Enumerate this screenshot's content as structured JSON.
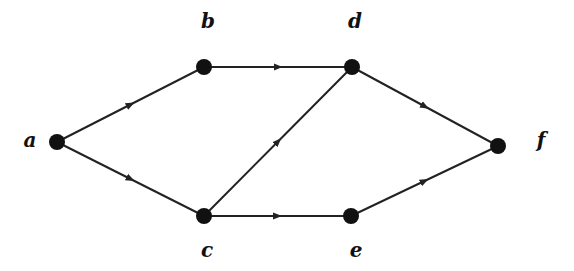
{
  "diagram": {
    "type": "directed-graph",
    "colors": {
      "node": "#111111",
      "edge": "#222222",
      "label": "#111111",
      "background": "#ffffff"
    },
    "nodes": [
      {
        "id": "a",
        "label": "a",
        "x": 57,
        "y": 142,
        "lx": 30,
        "ly": 147
      },
      {
        "id": "b",
        "label": "b",
        "x": 204,
        "y": 67,
        "lx": 208,
        "ly": 28
      },
      {
        "id": "c",
        "label": "c",
        "x": 204,
        "y": 216,
        "lx": 207,
        "ly": 257
      },
      {
        "id": "d",
        "label": "d",
        "x": 352,
        "y": 67,
        "lx": 355,
        "ly": 28
      },
      {
        "id": "e",
        "label": "e",
        "x": 351,
        "y": 216,
        "lx": 356,
        "ly": 257
      },
      {
        "id": "f",
        "label": "f",
        "x": 498,
        "y": 146,
        "lx": 541,
        "ly": 147
      }
    ],
    "edges": [
      {
        "from": "a",
        "to": "b"
      },
      {
        "from": "a",
        "to": "c"
      },
      {
        "from": "b",
        "to": "d"
      },
      {
        "from": "c",
        "to": "d"
      },
      {
        "from": "c",
        "to": "e"
      },
      {
        "from": "d",
        "to": "f"
      },
      {
        "from": "e",
        "to": "f"
      }
    ]
  }
}
